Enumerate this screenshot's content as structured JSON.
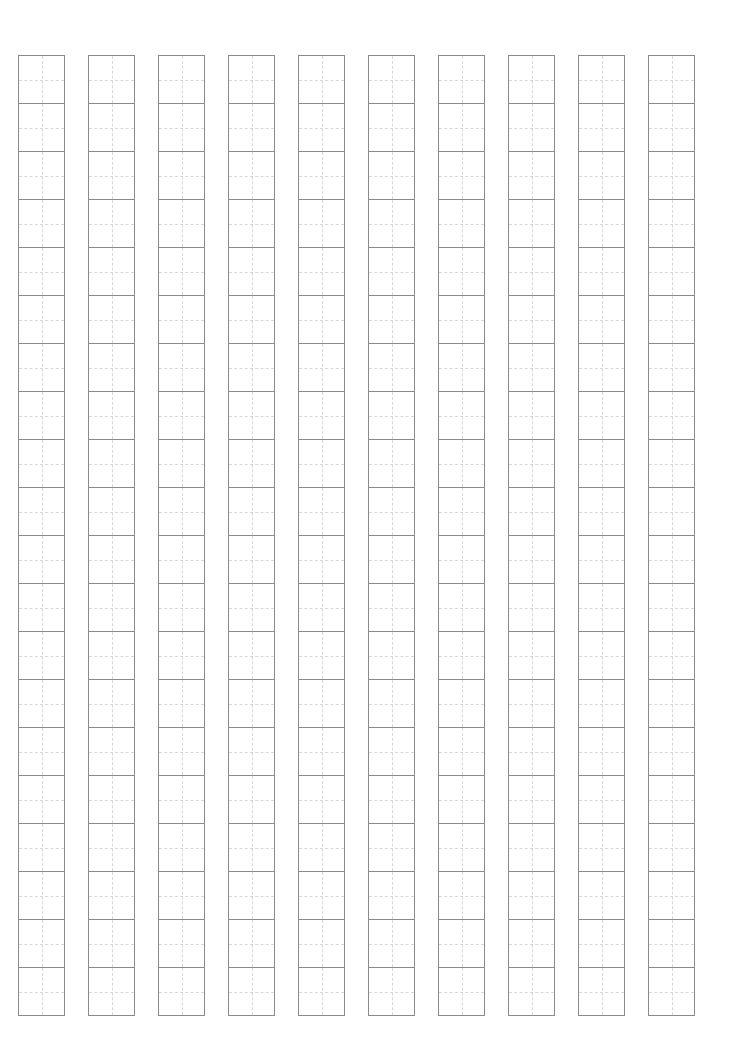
{
  "sheet": {
    "type": "tianzige-practice-grid",
    "columns": 10,
    "rows_per_column": 20,
    "column_left_positions": [
      18,
      88,
      158,
      228,
      298,
      368,
      438,
      508,
      578,
      648
    ],
    "cell_width": 47,
    "cell_height": 48,
    "top": 55,
    "colors": {
      "border": "#8a8a8a",
      "guide_lines": "#d8d8d8",
      "background": "#ffffff"
    }
  }
}
